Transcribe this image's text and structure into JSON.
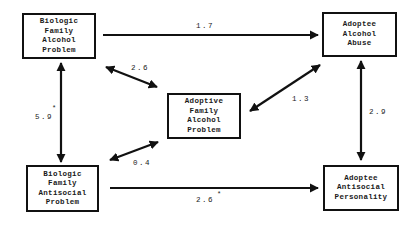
{
  "diagram": {
    "type": "path-diagram",
    "nodes": {
      "bio_alcohol": {
        "lines": [
          "Biologic",
          "Family",
          "Alcohol",
          "Problem"
        ]
      },
      "adoptee_alcohol": {
        "lines": [
          "Adoptee",
          "Alcohol",
          "Abuse"
        ]
      },
      "adoptive_alcohol": {
        "lines": [
          "Adoptive",
          "Family",
          "Alcohol",
          "Problem"
        ]
      },
      "bio_antisocial": {
        "lines": [
          "Biologic",
          "Family",
          "Antisocial",
          "Problem"
        ]
      },
      "adoptee_antisocial": {
        "lines": [
          "Adoptee",
          "Antisocial",
          "Personality"
        ]
      }
    },
    "edges": [
      {
        "from": "bio_alcohol",
        "to": "adoptee_alcohol",
        "value": "1.7",
        "significant": false,
        "direction": "one-way"
      },
      {
        "from": "bio_alcohol",
        "to": "adoptive_alcohol",
        "value": "2.6",
        "significant": false,
        "direction": "two-way"
      },
      {
        "from": "bio_alcohol",
        "to": "bio_antisocial",
        "value": "5.9",
        "significant": true,
        "direction": "two-way"
      },
      {
        "from": "adoptive_alcohol",
        "to": "adoptee_alcohol",
        "value": "1.3",
        "significant": false,
        "direction": "two-way"
      },
      {
        "from": "adoptee_alcohol",
        "to": "adoptee_antisocial",
        "value": "2.9",
        "significant": false,
        "direction": "two-way"
      },
      {
        "from": "bio_antisocial",
        "to": "adoptive_alcohol",
        "value": "0.4",
        "significant": false,
        "direction": "two-way"
      },
      {
        "from": "bio_antisocial",
        "to": "adoptee_antisocial",
        "value": "2.6",
        "significant": true,
        "direction": "one-way"
      }
    ],
    "significance_marker": "*",
    "colors": {
      "line": "#111111",
      "background": "#ffffff",
      "text": "#1a1a1a"
    }
  }
}
